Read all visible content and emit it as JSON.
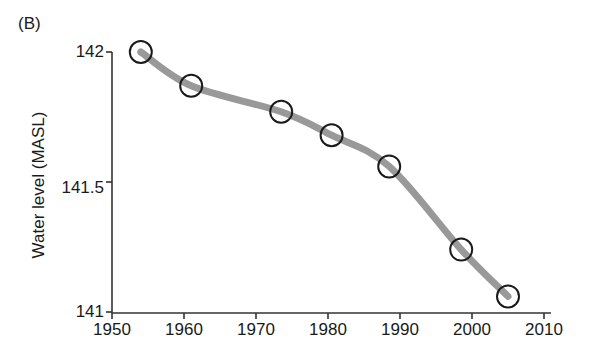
{
  "figure": {
    "panel_label": "(B)",
    "background_color": "#ffffff",
    "line_color": "#999999",
    "marker_edge_color": "#1a1a1a",
    "marker_fill_color": "#ffffff",
    "axis_color": "#333333"
  },
  "chart_data": {
    "type": "scatter",
    "title": "",
    "subtitle": "",
    "panel": "(B)",
    "xlabel": "",
    "ylabel": "Water level (MASL)",
    "xlim": [
      1950,
      2010
    ],
    "ylim": [
      141,
      142
    ],
    "xticks": [
      1950,
      1960,
      1970,
      1980,
      1990,
      2000,
      2010
    ],
    "xtick_labels": [
      "1950",
      "1960",
      "1970",
      "1980",
      "1990",
      "2000",
      "2010"
    ],
    "yticks": [
      141,
      141.5,
      142
    ],
    "ytick_labels": [
      "141",
      "141.5",
      "142"
    ],
    "grid": false,
    "legend": null,
    "series": [
      {
        "name": "Water level",
        "marker": "open-circle",
        "x": [
          1954,
          1961,
          1973.5,
          1980.5,
          1988.5,
          1998.5,
          2005
        ],
        "values": [
          142.0,
          141.87,
          141.77,
          141.68,
          141.56,
          141.24,
          141.06
        ]
      },
      {
        "name": "Trend curve",
        "marker": "none",
        "style": "thick-gray-curve",
        "x": [
          1954,
          1961,
          1973.5,
          1980.5,
          1988.5,
          1998.5,
          2005
        ],
        "values": [
          142.0,
          141.87,
          141.77,
          141.68,
          141.56,
          141.24,
          141.06
        ]
      }
    ]
  },
  "axes": {
    "y_tick_pixels": [
      52,
      188,
      312
    ],
    "x_tick_pixels": [
      112,
      184,
      256,
      328,
      400,
      472,
      544
    ]
  }
}
